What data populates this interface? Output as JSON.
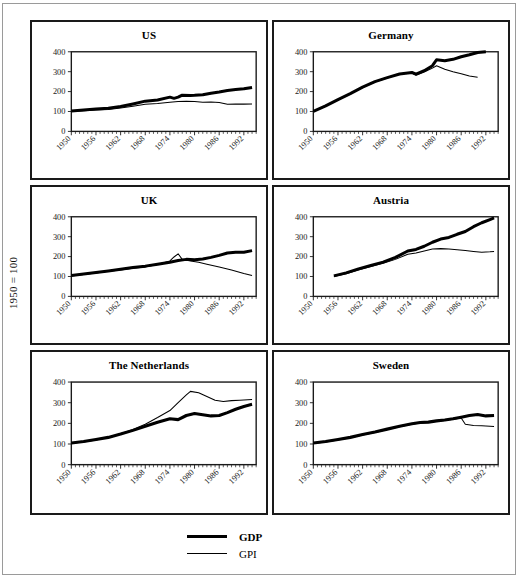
{
  "figure": {
    "y_axis_caption": "1950 = 100"
  },
  "legend": {
    "entries": [
      {
        "label": "GDP",
        "style": "thick"
      },
      {
        "label": "GPI",
        "style": "thin"
      }
    ]
  },
  "chart_data": [
    {
      "type": "line",
      "title": "US",
      "xlabel": "",
      "ylabel": "1950 = 100",
      "xlim": [
        1950,
        1995
      ],
      "ylim": [
        0,
        400
      ],
      "yticks": [
        0,
        100,
        200,
        300,
        400
      ],
      "xticks": [
        1950,
        1956,
        1962,
        1968,
        1974,
        1980,
        1986,
        1992
      ],
      "grid": false,
      "legend_position": "figure-bottom-center",
      "series": [
        {
          "name": "GDP",
          "x": [
            1950,
            1953,
            1956,
            1959,
            1962,
            1965,
            1968,
            1971,
            1974,
            1975,
            1976,
            1977,
            1979,
            1980,
            1982,
            1984,
            1986,
            1988,
            1990,
            1992,
            1994
          ],
          "values": [
            103,
            108,
            112,
            116,
            125,
            138,
            152,
            158,
            172,
            166,
            172,
            182,
            180,
            181,
            184,
            192,
            198,
            205,
            210,
            214,
            221
          ]
        },
        {
          "name": "GPI",
          "x": [
            1950,
            1953,
            1956,
            1959,
            1962,
            1965,
            1968,
            1971,
            1974,
            1976,
            1978,
            1980,
            1982,
            1984,
            1986,
            1988,
            1990,
            1992,
            1994
          ],
          "values": [
            100,
            104,
            107,
            110,
            117,
            126,
            136,
            140,
            147,
            150,
            152,
            150,
            146,
            148,
            145,
            136,
            138,
            137,
            138
          ]
        }
      ]
    },
    {
      "type": "line",
      "title": "Germany",
      "xlabel": "",
      "ylabel": "1950 = 100",
      "xlim": [
        1950,
        1995
      ],
      "ylim": [
        0,
        400
      ],
      "yticks": [
        0,
        100,
        200,
        300,
        400
      ],
      "xticks": [
        1950,
        1956,
        1962,
        1968,
        1974,
        1980,
        1986,
        1992
      ],
      "grid": false,
      "legend_position": "figure-bottom-center",
      "series": [
        {
          "name": "GDP",
          "x": [
            1950,
            1953,
            1956,
            1959,
            1962,
            1965,
            1968,
            1971,
            1974,
            1975,
            1977,
            1979,
            1980,
            1982,
            1984,
            1986,
            1988,
            1990,
            1992
          ],
          "values": [
            100,
            128,
            160,
            190,
            222,
            250,
            270,
            288,
            296,
            288,
            305,
            330,
            360,
            355,
            362,
            375,
            385,
            396,
            400
          ]
        },
        {
          "name": "GPI",
          "x": [
            1950,
            1953,
            1956,
            1959,
            1962,
            1965,
            1968,
            1971,
            1974,
            1975,
            1977,
            1979,
            1980,
            1982,
            1984,
            1986,
            1988,
            1990
          ],
          "values": [
            100,
            126,
            158,
            188,
            220,
            248,
            268,
            290,
            292,
            282,
            298,
            318,
            330,
            312,
            300,
            290,
            278,
            272
          ]
        }
      ]
    },
    {
      "type": "line",
      "title": "UK",
      "xlabel": "",
      "ylabel": "1950 = 100",
      "xlim": [
        1950,
        1995
      ],
      "ylim": [
        0,
        400
      ],
      "yticks": [
        0,
        100,
        200,
        300,
        400
      ],
      "xticks": [
        1950,
        1956,
        1962,
        1968,
        1974,
        1980,
        1986,
        1992
      ],
      "grid": false,
      "legend_position": "figure-bottom-center",
      "series": [
        {
          "name": "GDP",
          "x": [
            1950,
            1953,
            1956,
            1959,
            1962,
            1965,
            1968,
            1971,
            1974,
            1976,
            1978,
            1980,
            1982,
            1984,
            1986,
            1988,
            1990,
            1992,
            1994
          ],
          "values": [
            105,
            112,
            120,
            128,
            136,
            145,
            152,
            162,
            172,
            180,
            186,
            184,
            188,
            196,
            206,
            218,
            222,
            222,
            230
          ]
        },
        {
          "name": "GPI",
          "x": [
            1950,
            1953,
            1956,
            1959,
            1962,
            1965,
            1968,
            1971,
            1974,
            1975,
            1976,
            1977,
            1979,
            1981,
            1983,
            1986,
            1989,
            1992,
            1994
          ],
          "values": [
            102,
            110,
            118,
            126,
            133,
            142,
            148,
            160,
            178,
            198,
            214,
            186,
            178,
            172,
            162,
            148,
            132,
            115,
            105
          ]
        }
      ]
    },
    {
      "type": "line",
      "title": "Austria",
      "xlabel": "",
      "ylabel": "1950 = 100",
      "xlim": [
        1950,
        1995
      ],
      "ylim": [
        0,
        400
      ],
      "yticks": [
        0,
        100,
        200,
        300,
        400
      ],
      "xticks": [
        1950,
        1956,
        1962,
        1968,
        1974,
        1980,
        1986,
        1992
      ],
      "grid": false,
      "legend_position": "figure-bottom-center",
      "series": [
        {
          "name": "GDP",
          "x": [
            1955,
            1958,
            1961,
            1964,
            1967,
            1970,
            1973,
            1975,
            1977,
            1979,
            1981,
            1983,
            1985,
            1987,
            1989,
            1991,
            1993,
            1994
          ],
          "values": [
            103,
            118,
            138,
            155,
            172,
            196,
            228,
            236,
            252,
            272,
            288,
            296,
            312,
            326,
            350,
            370,
            386,
            394
          ]
        },
        {
          "name": "GPI",
          "x": [
            1955,
            1958,
            1961,
            1964,
            1967,
            1970,
            1973,
            1975,
            1977,
            1979,
            1981,
            1983,
            1985,
            1987,
            1989,
            1991,
            1993,
            1994
          ],
          "values": [
            100,
            114,
            132,
            150,
            166,
            186,
            212,
            218,
            228,
            238,
            240,
            238,
            234,
            230,
            226,
            222,
            224,
            226
          ]
        }
      ]
    },
    {
      "type": "line",
      "title": "The Netherlands",
      "xlabel": "",
      "ylabel": "1950 = 100",
      "xlim": [
        1950,
        1995
      ],
      "ylim": [
        0,
        400
      ],
      "yticks": [
        0,
        100,
        200,
        300,
        400
      ],
      "xticks": [
        1950,
        1956,
        1962,
        1968,
        1974,
        1980,
        1986,
        1992
      ],
      "grid": false,
      "legend_position": "figure-bottom-center",
      "series": [
        {
          "name": "GDP",
          "x": [
            1950,
            1953,
            1956,
            1959,
            1962,
            1965,
            1968,
            1971,
            1974,
            1976,
            1978,
            1980,
            1982,
            1984,
            1986,
            1988,
            1990,
            1992,
            1994
          ],
          "values": [
            105,
            112,
            122,
            132,
            148,
            166,
            186,
            205,
            222,
            218,
            238,
            248,
            242,
            236,
            238,
            252,
            268,
            282,
            292
          ]
        },
        {
          "name": "GPI",
          "x": [
            1950,
            1953,
            1956,
            1959,
            1962,
            1965,
            1968,
            1971,
            1974,
            1976,
            1978,
            1979,
            1981,
            1983,
            1985,
            1987,
            1989,
            1991,
            1994
          ],
          "values": [
            104,
            110,
            120,
            132,
            150,
            170,
            196,
            228,
            262,
            300,
            338,
            355,
            348,
            330,
            312,
            306,
            310,
            312,
            316
          ]
        }
      ]
    },
    {
      "type": "line",
      "title": "Sweden",
      "xlabel": "",
      "ylabel": "1950 = 100",
      "xlim": [
        1950,
        1995
      ],
      "ylim": [
        0,
        400
      ],
      "yticks": [
        0,
        100,
        200,
        300,
        400
      ],
      "xticks": [
        1950,
        1956,
        1962,
        1968,
        1974,
        1980,
        1986,
        1992
      ],
      "grid": false,
      "legend_position": "figure-bottom-center",
      "series": [
        {
          "name": "GDP",
          "x": [
            1950,
            1953,
            1956,
            1959,
            1962,
            1965,
            1968,
            1971,
            1974,
            1976,
            1978,
            1980,
            1982,
            1984,
            1986,
            1988,
            1990,
            1992,
            1994
          ],
          "values": [
            105,
            112,
            122,
            132,
            146,
            158,
            172,
            186,
            198,
            204,
            206,
            212,
            216,
            222,
            230,
            238,
            243,
            236,
            238
          ]
        },
        {
          "name": "GPI",
          "x": [
            1950,
            1953,
            1956,
            1959,
            1962,
            1965,
            1968,
            1971,
            1974,
            1976,
            1978,
            1980,
            1982,
            1984,
            1986,
            1987,
            1989,
            1991,
            1994
          ],
          "values": [
            103,
            110,
            120,
            130,
            144,
            156,
            170,
            184,
            196,
            202,
            204,
            210,
            214,
            220,
            226,
            196,
            190,
            188,
            185
          ]
        }
      ]
    }
  ]
}
